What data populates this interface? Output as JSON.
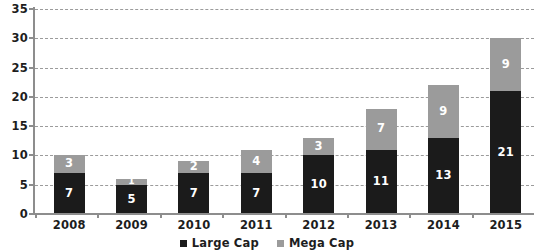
{
  "chart_data": {
    "type": "bar",
    "stacked": true,
    "title": "",
    "subtitle": "",
    "xlabel": "",
    "ylabel": "",
    "categories": [
      "2008",
      "2009",
      "2010",
      "2011",
      "2012",
      "2013",
      "2014",
      "2015"
    ],
    "series": [
      {
        "name": "Large Cap",
        "color": "#1b1b1b",
        "values": [
          7,
          5,
          7,
          7,
          10,
          11,
          13,
          21
        ]
      },
      {
        "name": "Mega Cap",
        "color": "#9b9b9b",
        "values": [
          3,
          1,
          2,
          4,
          3,
          7,
          9,
          9
        ]
      }
    ],
    "totals": [
      10,
      6,
      9,
      11,
      13,
      18,
      22,
      30
    ],
    "ylim": [
      0,
      35
    ],
    "ytick_values": [
      0,
      5,
      10,
      15,
      20,
      25,
      30,
      35
    ],
    "ytick_labels": [
      "0",
      "5",
      "10",
      "15",
      "20",
      "25",
      "30",
      "35"
    ],
    "grid": true,
    "grid_style": "dashed",
    "grid_color": "#9b9b9b",
    "legend_position": "bottom-center",
    "axis_color": "#8d8d8d",
    "label_color": "#1d1d1d",
    "data_label_color": "#ffffff",
    "background": "#ffffff"
  }
}
